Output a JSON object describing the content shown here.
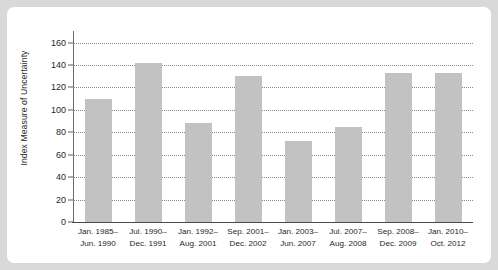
{
  "chart_data": {
    "type": "bar",
    "title": "",
    "subtitle": "",
    "xlabel": "",
    "ylabel": "Index Measure of Uncertainty",
    "ylim": [
      0,
      165
    ],
    "yticks": [
      0,
      20,
      40,
      60,
      80,
      100,
      120,
      140,
      160
    ],
    "ytick_labels": [
      "0",
      "20",
      "40",
      "60",
      "80",
      "100",
      "120",
      "140",
      "160"
    ],
    "grid": true,
    "grid_style": "dotted horizontal",
    "legend": null,
    "legend_position": "none",
    "bar_color": "#c2c2c2",
    "categories": [
      "Jan. 1985–\nJun. 1990",
      "Jul. 1990–\nDec. 1991",
      "Jan. 1992–\nAug. 2001",
      "Sep. 2001–\nDec. 2002",
      "Jan. 2003–\nJun. 2007",
      "Jul. 2007–\nAug. 2008",
      "Sep. 2008–\nDec. 2009",
      "Jan. 2010–\nOct. 2012"
    ],
    "category_lines": [
      [
        "Jan. 1985–",
        "Jun. 1990"
      ],
      [
        "Jul. 1990–",
        "Dec. 1991"
      ],
      [
        "Jan. 1992–",
        "Aug. 2001"
      ],
      [
        "Sep. 2001–",
        "Dec. 2002"
      ],
      [
        "Jan. 2003–",
        "Jun. 2007"
      ],
      [
        "Jul. 2007–",
        "Aug. 2008"
      ],
      [
        "Sep. 2008–",
        "Dec. 2009"
      ],
      [
        "Jan. 2010–",
        "Oct. 2012"
      ]
    ],
    "values": [
      110,
      142,
      88,
      130,
      72,
      85,
      133,
      133
    ]
  }
}
